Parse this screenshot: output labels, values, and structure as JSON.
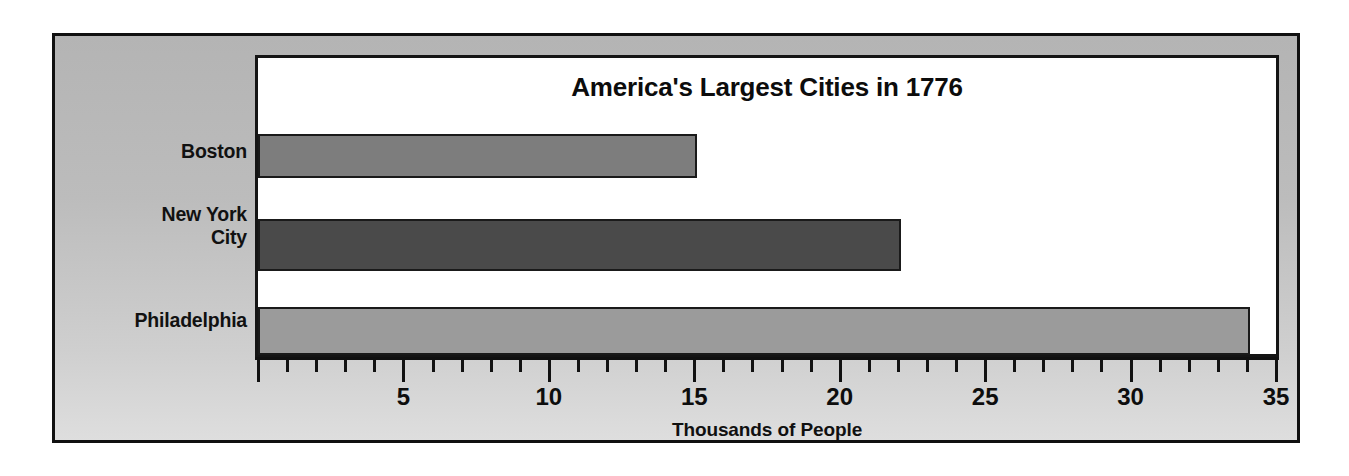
{
  "figure": {
    "background_color": "#bcbcbc",
    "border_color": "#101010",
    "plot_background_color": "#ffffff"
  },
  "chart_data": {
    "type": "bar",
    "orientation": "horizontal",
    "title": "America's Largest Cities in 1776",
    "xlabel": "Thousands of People",
    "ylabel": "",
    "categories": [
      "Boston",
      "New York City",
      "Philadelphia"
    ],
    "category_labels": [
      {
        "lines": [
          "Boston"
        ]
      },
      {
        "lines": [
          "New York",
          "City"
        ]
      },
      {
        "lines": [
          "Philadelphia"
        ]
      }
    ],
    "values": [
      15,
      22,
      34
    ],
    "bar_colors": [
      "#7d7d7d",
      "#4a4a4a",
      "#9b9b9b"
    ],
    "bar_border_color": "#1a1a1a",
    "xlim": [
      0,
      35
    ],
    "xticks": [
      0,
      5,
      10,
      15,
      20,
      25,
      30,
      35
    ],
    "xtick_labels": [
      "",
      "5",
      "10",
      "15",
      "20",
      "25",
      "30",
      "35"
    ],
    "minor_tick_interval": 1,
    "major_tick_interval": 5,
    "grid": false,
    "legend": false,
    "legend_position": "none"
  }
}
